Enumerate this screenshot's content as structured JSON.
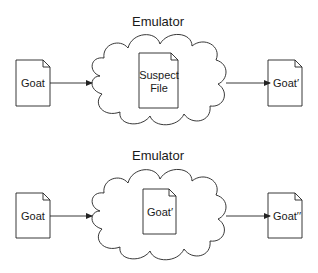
{
  "diagrams": [
    {
      "title": "Emulator",
      "input_file": "Goat",
      "inner_file_line1": "Suspect",
      "inner_file_line2": "File",
      "output_file": "Goat′"
    },
    {
      "title": "Emulator",
      "input_file": "Goat",
      "inner_file_line1": "Goat′",
      "inner_file_line2": "",
      "output_file": "Goat′′"
    }
  ],
  "colors": {
    "stroke": "#222222",
    "background": "#ffffff"
  }
}
